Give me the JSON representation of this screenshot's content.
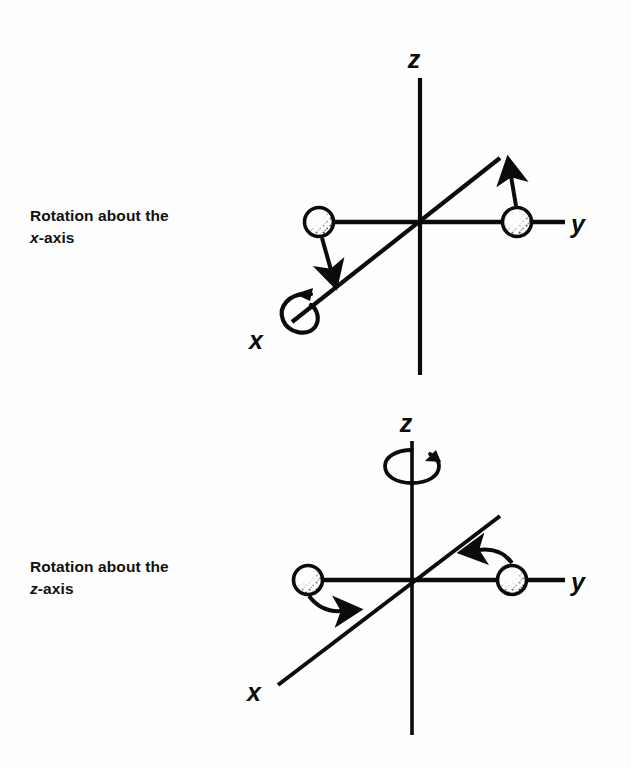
{
  "figure": {
    "background_color": "#fefefe",
    "ink_color": "#0b0b0b"
  },
  "panels": [
    {
      "id": "rotation-about-x",
      "caption_line1": "Rotation about the",
      "caption_axis": "x",
      "caption_suffix": "-axis",
      "origin": {
        "x": 420,
        "y": 222
      },
      "axes": [
        {
          "name": "z",
          "label": "z",
          "label_x": 414,
          "label_y": 68,
          "x1": 420,
          "y1": 78,
          "x2": 420,
          "y2": 375
        },
        {
          "name": "y",
          "label": "y",
          "label_x": 578,
          "label_y": 232,
          "x1": 420,
          "y1": 222,
          "x2": 565,
          "y2": 222
        },
        {
          "name": "x",
          "label": "x",
          "label_x": 256,
          "label_y": 348,
          "x1": 420,
          "y1": 222,
          "x2": 292,
          "y2": 322
        }
      ],
      "y_axis_left_segment": {
        "x1": 420,
        "y1": 222,
        "x2": 318,
        "y2": 222
      },
      "x_axis_upper_segment": {
        "x1": 420,
        "y1": 222,
        "x2": 500,
        "y2": 158
      },
      "atoms": [
        {
          "id": "atom-left",
          "cx": 319,
          "cy": 222,
          "r": 15,
          "shading": "stippled"
        },
        {
          "id": "atom-right",
          "cx": 517,
          "cy": 222,
          "r": 15,
          "shading": "stippled"
        }
      ],
      "displacement_arrows": [
        {
          "id": "arrow-left-down",
          "direction": "down",
          "x1": 322,
          "y1": 238,
          "x2": 332,
          "y2": 274
        },
        {
          "id": "arrow-right-up",
          "direction": "up",
          "x1": 516,
          "y1": 206,
          "x2": 510,
          "y2": 170
        }
      ],
      "rotation_indicator": {
        "id": "curl-about-x",
        "type": "open-loop-arrow",
        "about_axis": "x",
        "cx": 302,
        "cy": 312,
        "rx": 18,
        "ry": 21
      }
    },
    {
      "id": "rotation-about-z",
      "caption_line1": "Rotation about the",
      "caption_axis": "z",
      "caption_suffix": "-axis",
      "origin": {
        "x": 412,
        "y": 580
      },
      "axes": [
        {
          "name": "z",
          "label": "z",
          "label_x": 406,
          "label_y": 432,
          "x1": 412,
          "y1": 441,
          "x2": 412,
          "y2": 735
        },
        {
          "name": "y",
          "label": "y",
          "label_x": 578,
          "label_y": 590,
          "x1": 412,
          "y1": 580,
          "x2": 565,
          "y2": 580
        },
        {
          "name": "x",
          "label": "x",
          "label_x": 254,
          "label_y": 700,
          "x1": 412,
          "y1": 580,
          "x2": 278,
          "y2": 685
        }
      ],
      "y_axis_left_segment": {
        "x1": 412,
        "y1": 580,
        "x2": 310,
        "y2": 580
      },
      "x_axis_upper_segment": {
        "x1": 412,
        "y1": 580,
        "x2": 500,
        "y2": 516
      },
      "atoms": [
        {
          "id": "atom-left",
          "cx": 308,
          "cy": 580,
          "r": 15,
          "shading": "stippled"
        },
        {
          "id": "atom-right",
          "cx": 512,
          "cy": 580,
          "r": 15,
          "shading": "stippled"
        }
      ],
      "displacement_arrows": [
        {
          "id": "arrow-left-right",
          "direction": "right",
          "x1": 309,
          "y1": 596,
          "x2": 348,
          "y2": 610
        },
        {
          "id": "arrow-right-left",
          "direction": "left",
          "x1": 512,
          "y1": 562,
          "x2": 466,
          "y2": 552
        }
      ],
      "rotation_indicator": {
        "id": "curl-about-z",
        "type": "ellipse-loop-arrow",
        "about_axis": "z",
        "cx": 412,
        "cy": 465,
        "rx": 22,
        "ry": 15
      }
    }
  ]
}
